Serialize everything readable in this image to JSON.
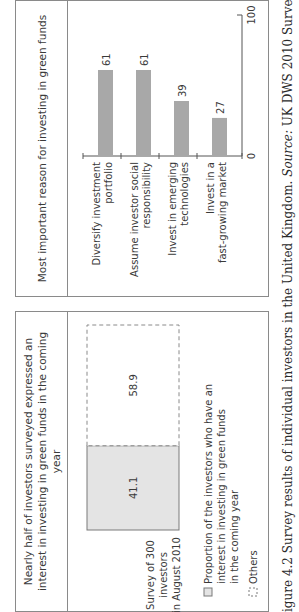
{
  "caption": {
    "figure_label": "igure 4.2",
    "text": " Survey results of individual investors in the United Kingdom.",
    "source_label": " Source:",
    "source_text": " UK DWS 2010 Survey"
  },
  "colors": {
    "bar_fill": "#a8a8a8",
    "stack_fill": "#e4e4e4",
    "border": "#8a8a8a",
    "text": "#3a3a3a"
  },
  "chart_data": [
    {
      "type": "bar",
      "orientation": "stacked-100",
      "title": "Nearly half of investors surveyed expressed an interest in investing in green funds in the coming year",
      "categories": [
        "Survey of 300 investors in August 2010"
      ],
      "category_label_lines": [
        "Survey of 300",
        "investors",
        "in August 2010"
      ],
      "series": [
        {
          "name": "Proportion of the investors who have an interest in investing in green funds in the coming year",
          "values": [
            41.1
          ],
          "style": "solid-light-grey"
        },
        {
          "name": "Others",
          "values": [
            58.9
          ],
          "style": "dashed-outline"
        }
      ],
      "data_labels": [
        "41.1",
        "58.9"
      ],
      "legend": [
        {
          "lines": [
            "Proportion of the investors who have an",
            "interest in investing in green funds",
            "in the coming year"
          ],
          "style": "solid-light-grey"
        },
        {
          "lines": [
            "Others"
          ],
          "style": "dashed-outline"
        }
      ],
      "legend_placement": "bottom-left",
      "ylim": [
        0,
        100
      ]
    },
    {
      "type": "bar",
      "title": "Most important reason for investing in green funds",
      "categories": [
        "Diversify investment portfolio",
        "Assume investor social responsibility",
        "Invest in emerging technologies",
        "Invest in a fast-growing market"
      ],
      "category_label_lines": [
        [
          "Diversify investment",
          "portfolio"
        ],
        [
          "Assume investor social",
          "responsibility"
        ],
        [
          "Invest in emerging",
          "technologies"
        ],
        [
          "Invest in a",
          "fast-growing market"
        ]
      ],
      "values": [
        61,
        61,
        39,
        27
      ],
      "data_labels": [
        "61",
        "61",
        "39",
        "27"
      ],
      "ylim": [
        0,
        100
      ],
      "yticks": [
        "0",
        "100"
      ],
      "xlabel": "",
      "ylabel": "",
      "grid": false
    }
  ]
}
